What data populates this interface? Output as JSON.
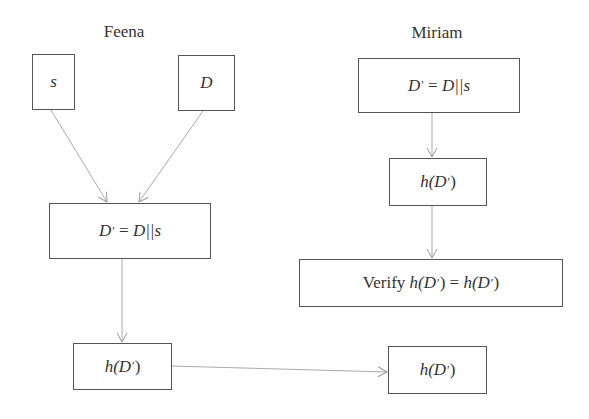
{
  "diagram": {
    "participants": [
      {
        "name": "Feena"
      },
      {
        "name": "Miriam"
      }
    ],
    "nodes": {
      "feena_s": {
        "text": "s"
      },
      "feena_D": {
        "text": "D"
      },
      "feena_concat": {
        "lhs": "D",
        "prime": "′",
        "eq": " = ",
        "rhs": "D||s"
      },
      "feena_hash": {
        "pre": "h(D",
        "prime": "′",
        "post": ")"
      },
      "miriam_concat": {
        "lhs": "D",
        "prime": "′",
        "eq": " = ",
        "rhs": "D||s"
      },
      "miriam_hash": {
        "pre": "h(D",
        "prime": "′",
        "post": ")"
      },
      "miriam_verify": {
        "verb": "Verify ",
        "pre1": "h(D",
        "prime1": "′",
        "post1": ")",
        "eq": " = ",
        "pre2": "h(D",
        "prime2": "′",
        "post2": ")"
      },
      "received_hash": {
        "pre": "h(D",
        "prime": "′",
        "post": ")"
      }
    },
    "edges": [
      {
        "from": "feena_s",
        "to": "feena_concat"
      },
      {
        "from": "feena_D",
        "to": "feena_concat"
      },
      {
        "from": "feena_concat",
        "to": "feena_hash"
      },
      {
        "from": "feena_hash",
        "to": "received_hash"
      },
      {
        "from": "miriam_concat",
        "to": "miriam_hash"
      },
      {
        "from": "miriam_hash",
        "to": "miriam_verify"
      }
    ],
    "colors": {
      "line": "#999999",
      "box_border": "#555555",
      "text": "#333333"
    }
  }
}
